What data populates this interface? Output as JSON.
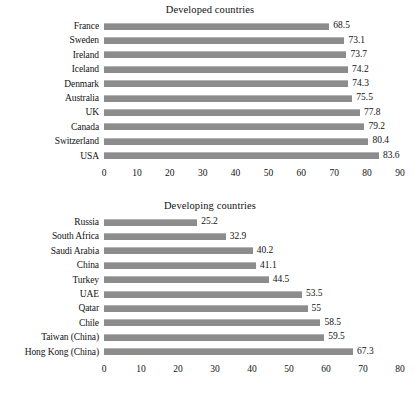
{
  "chart_data": [
    {
      "type": "bar",
      "orientation": "horizontal",
      "title": "Developed countries",
      "xlabel": "",
      "ylabel": "",
      "xlim": [
        0,
        90
      ],
      "xticks": [
        0,
        10,
        20,
        30,
        40,
        50,
        60,
        70,
        80,
        90
      ],
      "grid": false,
      "legend": false,
      "bar_color": "#8c8c8c",
      "categories": [
        "France",
        "Sweden",
        "Ireland",
        "Iceland",
        "Denmark",
        "Australia",
        "UK",
        "Canada",
        "Switzerland",
        "USA"
      ],
      "values": [
        68.5,
        73.1,
        73.7,
        74.2,
        74.3,
        75.5,
        77.8,
        79.2,
        80.4,
        83.6
      ],
      "value_labels": [
        "68.5",
        "73.1",
        "73.7",
        "74.2",
        "74.3",
        "75.5",
        "77.8",
        "79.2",
        "80.4",
        "83.6"
      ]
    },
    {
      "type": "bar",
      "orientation": "horizontal",
      "title": "Developing countries",
      "xlabel": "",
      "ylabel": "",
      "xlim": [
        0,
        80
      ],
      "xticks": [
        0,
        10,
        20,
        30,
        40,
        50,
        60,
        70,
        80
      ],
      "grid": false,
      "legend": false,
      "bar_color": "#8c8c8c",
      "categories": [
        "Russia",
        "South Africa",
        "Saudi Arabia",
        "China",
        "Turkey",
        "UAE",
        "Qatar",
        "Chile",
        "Taiwan (China)",
        "Hong Kong (China)"
      ],
      "values": [
        25.2,
        32.9,
        40.2,
        41.1,
        44.5,
        53.5,
        55,
        58.5,
        59.5,
        67.3
      ],
      "value_labels": [
        "25.2",
        "32.9",
        "40.2",
        "41.1",
        "44.5",
        "53.5",
        "55",
        "58.5",
        "59.5",
        "67.3"
      ]
    }
  ]
}
